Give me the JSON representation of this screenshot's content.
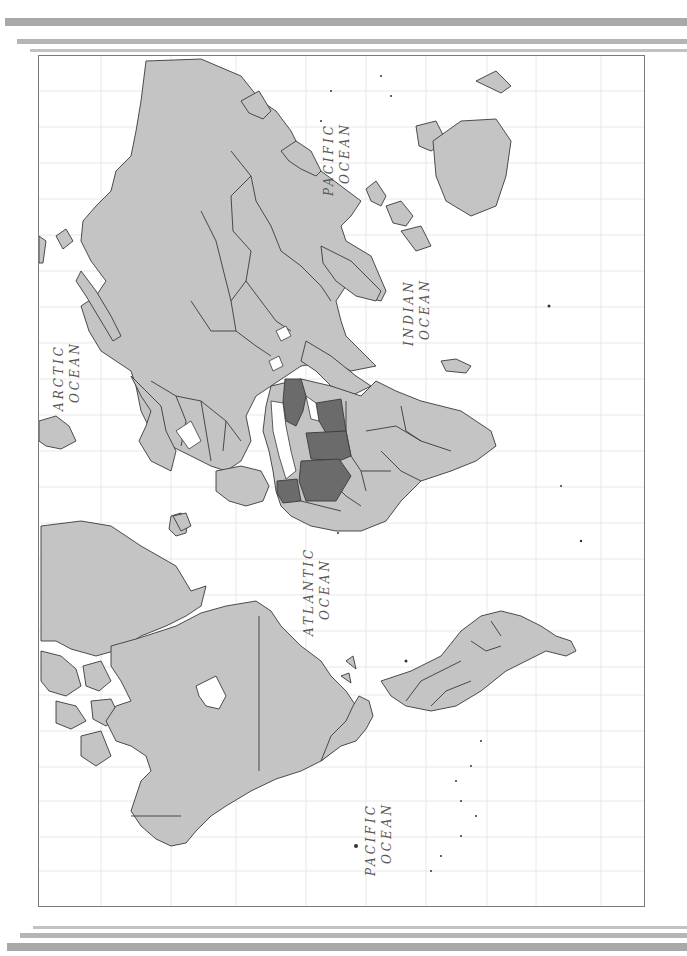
{
  "map": {
    "orientation": "rotated 90° counter-clockwise (north points left)",
    "style": "political world map, grayscale",
    "colors": {
      "land": "#c4c4c4",
      "highlight": "#6b6b6b",
      "border": "#3a3a3a",
      "water": "#ffffff",
      "grid": "#e6e6e6",
      "decor_bars": "#a9a9a9"
    },
    "labels": [
      {
        "id": "arctic",
        "line1": "ARCTIC",
        "line2": "OCEAN"
      },
      {
        "id": "pacific_east",
        "line1": "PACIFIC",
        "line2": "OCEAN"
      },
      {
        "id": "indian",
        "line1": "INDIAN",
        "line2": "OCEAN"
      },
      {
        "id": "atlantic",
        "line1": "ATLANTIC",
        "line2": "OCEAN"
      },
      {
        "id": "pacific_west",
        "line1": "PACIFIC",
        "line2": "OCEAN"
      }
    ],
    "highlighted_region_count": 5
  }
}
